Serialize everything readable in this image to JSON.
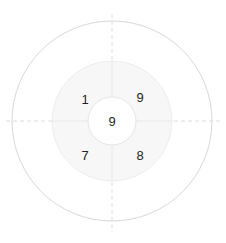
{
  "diagram": {
    "type": "concentric-target",
    "width": 226,
    "height": 243,
    "center": {
      "x": 112,
      "y": 121
    },
    "background_color": "#ffffff",
    "rings": [
      {
        "name": "outer-ring",
        "radius": 100,
        "fill": "#ffffff",
        "stroke": "#d8d8d8"
      },
      {
        "name": "middle-ring",
        "radius": 60,
        "fill": "#f7f7f7",
        "stroke": "#ededed"
      },
      {
        "name": "center-ring",
        "radius": 24,
        "fill": "#ffffff",
        "stroke": "#e4e4e4"
      }
    ],
    "axes": {
      "style": "dashed",
      "color": "#dcdcdc",
      "horizontal_label": "horizontal-axis",
      "vertical_label": "vertical-axis"
    },
    "labels": {
      "top_left": "1",
      "top_right": "9",
      "bottom_left": "7",
      "bottom_right": "8",
      "center": "9"
    },
    "label_color": "#231f20"
  }
}
